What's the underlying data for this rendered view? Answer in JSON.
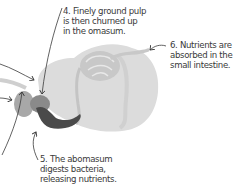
{
  "diagram": {
    "colors": {
      "intestine": "#c8c8c8",
      "rumen": "#dcdcdc",
      "reticulum": "#a8a8a8",
      "omasum": "#8a8a8a",
      "abomasum": "#4a4a4a",
      "arrow": "#3a3a3a",
      "text": "#3a3a3a"
    },
    "labels": [
      {
        "number": "4",
        "lines": [
          "4. Finely ground pulp",
          "is then churned up",
          "in the omasum."
        ]
      },
      {
        "number": "5",
        "lines": [
          "5. The abomasum",
          "digests bacteria,",
          "releasing nutrients."
        ]
      },
      {
        "number": "6",
        "lines": [
          "6. Nutrients are",
          "absorbed in the",
          "small intestine."
        ]
      }
    ]
  }
}
